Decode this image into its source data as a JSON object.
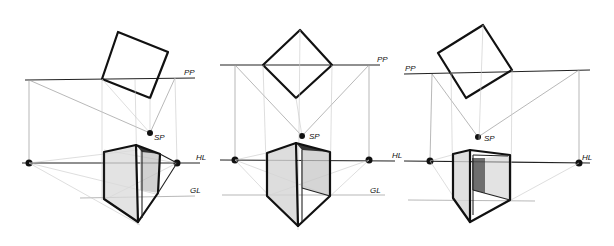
{
  "panels": [
    {
      "id": "left",
      "labels": {
        "picture_plane": "PP",
        "station_point": "SP",
        "horizon_line": "HL",
        "ground_line": "GL"
      },
      "plan_square": [
        [
          118,
          32
        ],
        [
          168,
          52
        ],
        [
          150,
          98
        ],
        [
          102,
          79
        ]
      ],
      "pp_y": 80,
      "pp_x": [
        25,
        190
      ],
      "sp": [
        148,
        133
      ],
      "hl_y": 163,
      "hl_x": [
        25,
        195
      ],
      "gl_y": 198,
      "gl_x": [
        80,
        195
      ],
      "vp_left": [
        29,
        163
      ],
      "vp_right": [
        177,
        163
      ]
    },
    {
      "id": "center",
      "labels": {
        "picture_plane": "PP",
        "station_point": "SP",
        "horizon_line": "HL",
        "ground_line": "GL"
      },
      "plan_square": [
        [
          300,
          30
        ],
        [
          332,
          65
        ],
        [
          296,
          98
        ],
        [
          263,
          65
        ]
      ],
      "pp_y": 65,
      "pp_x": [
        222,
        380
      ],
      "sp": [
        302,
        136
      ],
      "hl_y": 160,
      "hl_x": [
        222,
        395
      ],
      "gl_y": 195,
      "gl_x": [
        225,
        385
      ],
      "vp_left": [
        235,
        160
      ],
      "vp_right": [
        369,
        160
      ]
    },
    {
      "id": "right",
      "labels": {
        "picture_plane": "PP",
        "station_point": "SP",
        "horizon_line": "HL",
        "ground_line": "GL"
      },
      "plan_square": [
        [
          483,
          25
        ],
        [
          512,
          70
        ],
        [
          466,
          98
        ],
        [
          438,
          53
        ]
      ],
      "pp_y": 72,
      "pp_x": [
        404,
        590
      ],
      "sp": [
        478,
        137
      ],
      "hl_y": 161,
      "hl_x": [
        404,
        590
      ],
      "gl_y": 200,
      "gl_x": [
        408,
        535
      ],
      "vp_left": [
        430,
        161
      ],
      "vp_right": [
        579,
        163
      ]
    }
  ]
}
